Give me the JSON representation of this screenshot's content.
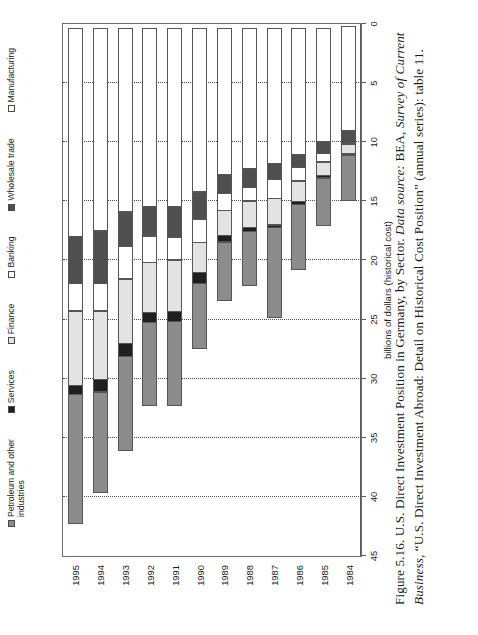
{
  "figure": {
    "caption_number": "Figure 5.16.",
    "caption_title": "U.S. Direct Investment Position in Germany, by Sector.",
    "caption_source_label": "Data source:",
    "caption_source_agency": "BEA,",
    "caption_source_pub": "Survey of Current Business",
    "caption_source_rest": ", “U.S. Direct Investment Abroad: Detail on Historical Cost Position” (annual series): table 11."
  },
  "axis": {
    "value_axis_title": "billions of dollars (historical cost)",
    "value_ticks": [
      "0",
      "5",
      "10",
      "15",
      "20",
      "25",
      "30",
      "35",
      "40",
      "45"
    ],
    "value_min": 0,
    "value_max": 45,
    "category_axis_title": ""
  },
  "legend": {
    "items": [
      {
        "label": "Petroleum and other\nindustries",
        "color": "#8c8c8c"
      },
      {
        "label": "Services",
        "color": "#1f1f1f"
      },
      {
        "label": "Finance",
        "color": "#e3e3e3"
      },
      {
        "label": "Banking",
        "color": "#ffffff"
      },
      {
        "label": "Wholesale trade",
        "color": "#4f4f4f"
      },
      {
        "label": "Manufacturing",
        "color": "#ffffff"
      }
    ]
  },
  "chart_data": {
    "type": "bar",
    "orientation": "horizontal-stacked",
    "title": "U.S. Direct Investment Position in Germany, by Sector",
    "xlabel": "billions of dollars (historical cost)",
    "ylabel": "",
    "xlim": [
      0,
      45
    ],
    "grid": true,
    "legend_position": "top",
    "categories": [
      "1984",
      "1985",
      "1986",
      "1987",
      "1988",
      "1989",
      "1990",
      "1991",
      "1992",
      "1993",
      "1994",
      "1995"
    ],
    "series": [
      {
        "name": "Manufacturing",
        "color": "#ffffff",
        "values": [
          8.9,
          9.6,
          10.7,
          11.5,
          11.9,
          12.4,
          13.9,
          15.1,
          15.1,
          15.6,
          17.2,
          17.7
        ]
      },
      {
        "name": "Wholesale trade",
        "color": "#4f4f4f",
        "values": [
          1.1,
          1.1,
          1.2,
          1.4,
          1.7,
          1.7,
          2.4,
          2.7,
          2.6,
          3.0,
          4.5,
          4.0
        ]
      },
      {
        "name": "Banking",
        "color": "#ffffff",
        "values": [
          0.0,
          0.8,
          1.2,
          1.7,
          1.2,
          1.5,
          2.0,
          2.0,
          2.3,
          2.8,
          2.4,
          2.4
        ]
      },
      {
        "name": "Finance",
        "color": "#e3e3e3",
        "values": [
          0.9,
          1.2,
          1.8,
          2.3,
          2.3,
          2.2,
          2.6,
          4.4,
          4.3,
          5.5,
          5.9,
          6.4
        ]
      },
      {
        "name": "Services",
        "color": "#1f1f1f",
        "values": [
          0.2,
          0.3,
          0.3,
          0.3,
          0.4,
          0.6,
          1.0,
          0.9,
          0.9,
          1.2,
          1.1,
          0.8
        ]
      },
      {
        "name": "Petroleum and other industries",
        "color": "#8c8c8c",
        "values": [
          3.9,
          4.1,
          5.6,
          7.7,
          4.7,
          5.0,
          5.6,
          7.2,
          7.1,
          8.0,
          8.6,
          11.0
        ]
      }
    ],
    "totals": [
      15.0,
      17.1,
      20.8,
      24.9,
      22.2,
      23.4,
      27.5,
      32.3,
      32.3,
      36.1,
      39.7,
      42.3
    ]
  }
}
